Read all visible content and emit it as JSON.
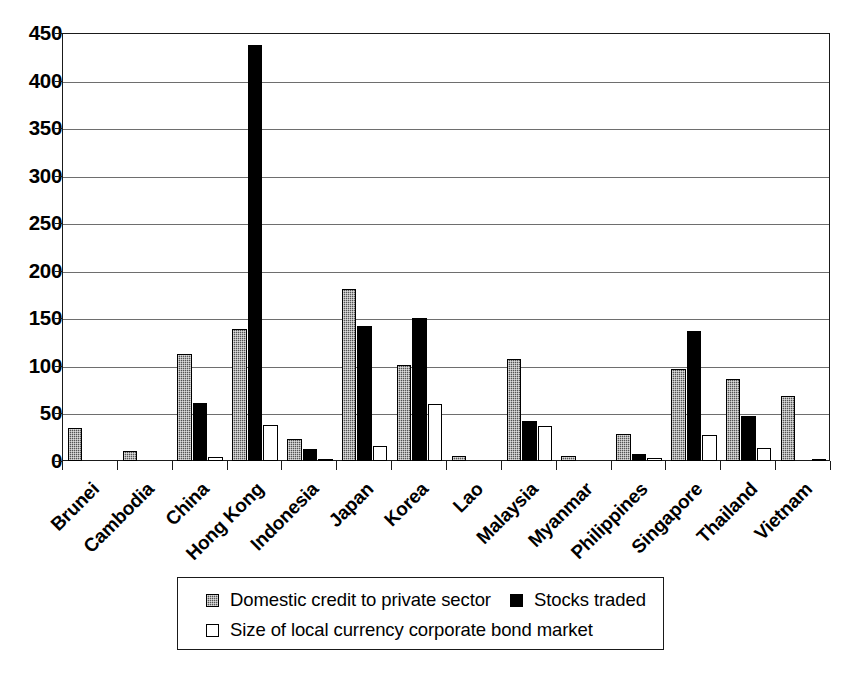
{
  "chart_data": {
    "type": "bar",
    "title": "",
    "subtitle": "",
    "xlabel": "",
    "ylabel": "",
    "ylim": [
      0,
      450
    ],
    "ytick_step": 50,
    "yticks": [
      0,
      50,
      100,
      150,
      200,
      250,
      300,
      350,
      400,
      450
    ],
    "ytick_labels": [
      "0",
      "50",
      "100",
      "150",
      "200",
      "250",
      "300",
      "350",
      "400",
      "450"
    ],
    "grid": true,
    "grid_axis": "y",
    "legend_position": "bottom",
    "categories": [
      "Brunei",
      "Cambodia",
      "China",
      "Hong Kong",
      "Indonesia",
      "Japan",
      "Korea",
      "Lao",
      "Malaysia",
      "Myanmar",
      "Philippines",
      "Singapore",
      "Thailand",
      "Vietnam"
    ],
    "series": [
      {
        "name": "Domestic credit to private sector",
        "swatch": "s0",
        "color": "#555555",
        "values": [
          35,
          11,
          113,
          139,
          23,
          181,
          101,
          5,
          107,
          5,
          28,
          97,
          86,
          68
        ]
      },
      {
        "name": "Stocks traded",
        "swatch": "s1",
        "color": "#000000",
        "values": [
          0,
          0,
          61,
          437,
          13,
          142,
          150,
          0,
          42,
          0,
          7,
          137,
          47,
          0
        ]
      },
      {
        "name": "Size of local currency corporate bond market",
        "swatch": "s2",
        "color": "#ffffff",
        "values": [
          0,
          0,
          4,
          38,
          2,
          16,
          60,
          0,
          37,
          0,
          3,
          27,
          14,
          2
        ]
      }
    ]
  },
  "legend": {
    "entries": [
      {
        "label": "Domestic credit to private sector",
        "swatch": "s0"
      },
      {
        "label": "Stocks traded",
        "swatch": "s1"
      },
      {
        "label": "Size of local currency corporate bond market",
        "swatch": "s2"
      }
    ]
  }
}
